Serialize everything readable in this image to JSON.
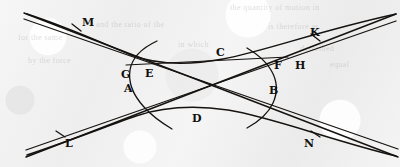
{
  "figure": {
    "width": 400,
    "height": 167,
    "background_color": "#f0f0f0",
    "ink_color": "#15120f"
  },
  "labels": [
    {
      "id": "M",
      "text": "M",
      "x": 82,
      "y": 17,
      "role": "tick-mark-upper-left-asymptote"
    },
    {
      "id": "K",
      "text": "K",
      "x": 310,
      "y": 27,
      "role": "tick-mark-upper-right-asymptote"
    },
    {
      "id": "C",
      "text": "C",
      "x": 216,
      "y": 47,
      "role": "upper-arc"
    },
    {
      "id": "G",
      "text": "G",
      "x": 121,
      "y": 69,
      "role": "left-vertex-region"
    },
    {
      "id": "E",
      "text": "E",
      "x": 145,
      "y": 68,
      "role": "chord-endpoint-left"
    },
    {
      "id": "F",
      "text": "F",
      "x": 274,
      "y": 60,
      "role": "chord-endpoint-right"
    },
    {
      "id": "H",
      "text": "H",
      "x": 295,
      "y": 60,
      "role": "right-branch-upper"
    },
    {
      "id": "A",
      "text": "A",
      "x": 124,
      "y": 83,
      "role": "left-branch"
    },
    {
      "id": "B",
      "text": "B",
      "x": 269,
      "y": 85,
      "role": "right-branch"
    },
    {
      "id": "D",
      "text": "D",
      "x": 192,
      "y": 113,
      "role": "lower-arc"
    },
    {
      "id": "L",
      "text": "L",
      "x": 65,
      "y": 138,
      "role": "tick-mark-lower-left-asymptote"
    },
    {
      "id": "N",
      "text": "N",
      "x": 304,
      "y": 138,
      "role": "tick-mark-lower-right-asymptote"
    }
  ],
  "curves": [
    {
      "id": "asymptote-upper-outer",
      "kind": "straight-line",
      "description": "upper-left to lower-right long straight line, outer of pair"
    },
    {
      "id": "asymptote-upper-inner",
      "kind": "straight-line",
      "description": "upper-left to lower-right long straight line, inner of pair"
    },
    {
      "id": "asymptote-lower-outer",
      "kind": "straight-line",
      "description": "lower-left to upper-right long straight line, outer of pair"
    },
    {
      "id": "asymptote-lower-inner",
      "kind": "straight-line",
      "description": "lower-left to upper-right long straight line, inner of pair"
    },
    {
      "id": "hyperbola-upper-branch",
      "kind": "hyperbola-branch",
      "description": "upper opening branch passing through C"
    },
    {
      "id": "hyperbola-lower-branch",
      "kind": "hyperbola-branch",
      "description": "lower opening branch passing through D"
    },
    {
      "id": "hyperbola-left-branch",
      "kind": "hyperbola-branch",
      "description": "left opening branch A with vertex at G"
    },
    {
      "id": "hyperbola-right-branch",
      "kind": "hyperbola-branch",
      "description": "right opening branch B with vertex near F"
    },
    {
      "id": "chord-EF",
      "kind": "straight-line",
      "description": "near-horizontal chord from E to F"
    },
    {
      "id": "tick-M",
      "kind": "tick-mark",
      "description": "short cross stroke on upper-left asymptote at M"
    },
    {
      "id": "tick-K",
      "kind": "tick-mark",
      "description": "short cross stroke on upper-right asymptote at K"
    },
    {
      "id": "tick-L",
      "kind": "tick-mark",
      "description": "short cross stroke on lower-left asymptote at L"
    },
    {
      "id": "tick-N",
      "kind": "tick-mark",
      "description": "short cross stroke on lower-right asymptote at N"
    }
  ],
  "ghost_text": [
    {
      "text": "the quantity of motion in",
      "x": 230,
      "y": 3
    },
    {
      "text": "and the ratio of the",
      "x": 96,
      "y": 20
    },
    {
      "text": "is therefore as",
      "x": 268,
      "y": 22
    },
    {
      "text": "for the same",
      "x": 18,
      "y": 33
    },
    {
      "text": "in which",
      "x": 178,
      "y": 40
    },
    {
      "text": "described",
      "x": 300,
      "y": 44
    },
    {
      "text": "by the force",
      "x": 28,
      "y": 56
    },
    {
      "text": "equal",
      "x": 330,
      "y": 60
    }
  ]
}
